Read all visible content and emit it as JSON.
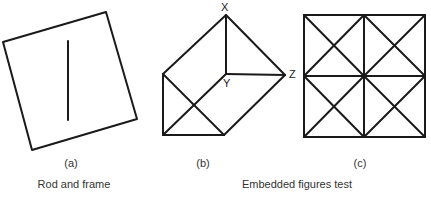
{
  "panels": [
    {
      "id": "a",
      "label": "(a)",
      "shape": "tilted square frame with vertical rod"
    },
    {
      "id": "b",
      "label": "(b)",
      "shape": "prism figure with labeled vertices",
      "vertices": [
        "X",
        "Y",
        "Z"
      ]
    },
    {
      "id": "c",
      "label": "(c)",
      "shape": "square grid 2x2 with diagonals"
    }
  ],
  "captions": {
    "left": "Rod and frame",
    "right": "Embedded figures test"
  },
  "vertex_labels": {
    "x": "X",
    "y": "Y",
    "z": "Z"
  },
  "colors": {
    "stroke": "#1a1a1a",
    "background": "#ffffff"
  }
}
